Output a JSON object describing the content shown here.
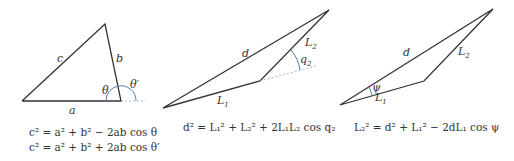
{
  "figure": {
    "panels": [
      {
        "name": "law-of-cosines",
        "side_labels": {
          "a": "a",
          "b": "b",
          "c": "c"
        },
        "angle_labels": {
          "theta": "θ",
          "theta_prime": "θ′"
        },
        "equations": [
          "c² = a² + b² − 2ab cos θ",
          "c² = a² + b² + 2ab cos θ′"
        ]
      },
      {
        "name": "two-link-arm-q2",
        "side_labels": {
          "d": "d",
          "L1": "L",
          "L1_sub": "1",
          "L2": "L",
          "L2_sub": "2"
        },
        "angle_labels": {
          "q2": "q",
          "q2_sub": "2"
        },
        "equations": [
          "d² = L₁² + L₂² + 2L₁L₂ cos q₂"
        ]
      },
      {
        "name": "two-link-arm-psi",
        "side_labels": {
          "d": "d",
          "L1": "L",
          "L1_sub": "1",
          "L2": "L",
          "L2_sub": "2"
        },
        "angle_labels": {
          "psi": "ψ"
        },
        "equations": [
          "L₂² = d² + L₁² − 2dL₁ cos ψ"
        ]
      }
    ],
    "colors": {
      "line": "#333333",
      "arc": "#4a7fb5",
      "dash": "#8aaed0"
    }
  }
}
